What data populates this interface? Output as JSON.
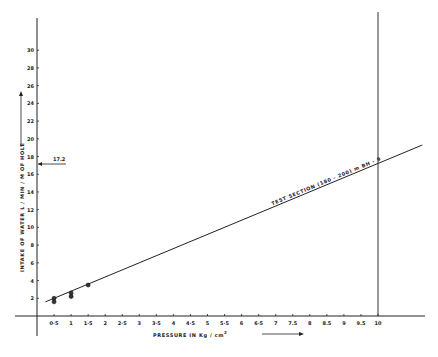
{
  "chart_data": {
    "type": "line",
    "title": "",
    "xlabel": "PRESSURE IN Kg / cm²",
    "ylabel": "INTAKE OF WATER L / MIN / M OF HOLE",
    "xlim": [
      0,
      10
    ],
    "ylim": [
      0,
      30
    ],
    "grid": false,
    "x_ticks": [
      "0·5",
      "1",
      "1·5",
      "2",
      "2·5",
      "3",
      "3·5",
      "4",
      "4·5",
      "5",
      "5·5",
      "6",
      "6·5",
      "7",
      "7.5",
      "8",
      "8.5",
      "9",
      "9.5",
      "10"
    ],
    "x_tick_values": [
      0.5,
      1,
      1.5,
      2,
      2.5,
      3,
      3.5,
      4,
      4.5,
      5,
      5.5,
      6,
      6.5,
      7,
      7.5,
      8,
      8.5,
      9,
      9.5,
      10
    ],
    "y_ticks": [
      "2",
      "4",
      "6",
      "8",
      "10",
      "12",
      "14",
      "16",
      "18",
      "20",
      "22",
      "24",
      "26",
      "28",
      "30"
    ],
    "y_tick_values": [
      2,
      4,
      6,
      8,
      10,
      12,
      14,
      16,
      18,
      20,
      22,
      24,
      26,
      28,
      30
    ],
    "series": [
      {
        "name": "TEST SECTION (180 - 200) m BH - 9",
        "kind": "fitted-line",
        "x": [
          0.25,
          11.3
        ],
        "y": [
          1.6,
          19.3
        ]
      },
      {
        "name": "observations",
        "kind": "scatter",
        "x": [
          0.5,
          0.5,
          1,
          1,
          1.5
        ],
        "y": [
          2.0,
          1.6,
          2.6,
          2.2,
          3.5
        ]
      }
    ],
    "annotations": [
      {
        "text": "TEST SECTION (180 - 200) m BH - 9",
        "type": "line-label"
      },
      {
        "text": "17.2",
        "type": "y-axis-marker",
        "y": 17.2
      },
      {
        "text": "vertical reference line",
        "type": "vline",
        "x": 10
      }
    ],
    "legend": "none"
  },
  "labels": {
    "xlabel": "PRESSURE IN Kg / cm",
    "xlabel_sup": "2",
    "ylabel": "INTAKE OF WATER L / MIN / M OF HOLE",
    "line_label": "TEST SECTION (180 - 200) m BH - 9",
    "marker_value": "17.2"
  }
}
